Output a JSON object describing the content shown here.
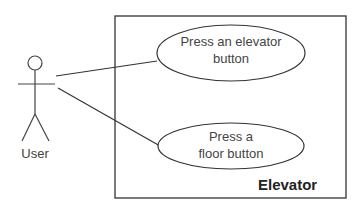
{
  "diagram": {
    "type": "use-case",
    "actor": {
      "label": "User"
    },
    "system": {
      "label": "Elevator"
    },
    "use_cases": [
      {
        "label_line1": "Press an elevator",
        "label_line2": "button"
      },
      {
        "label_line1": "Press a",
        "label_line2": "floor button"
      }
    ],
    "colors": {
      "stroke": "#333333",
      "text": "#444444"
    }
  }
}
